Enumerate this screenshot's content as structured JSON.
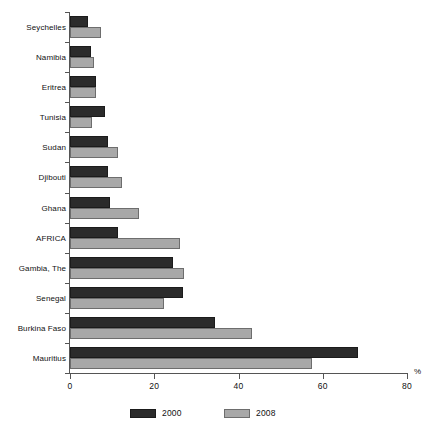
{
  "chart_data": {
    "type": "bar",
    "orientation": "horizontal",
    "title": "",
    "xlabel": "%",
    "ylabel": "",
    "xlim": [
      0,
      80
    ],
    "xticks": [
      0,
      20,
      40,
      60,
      80
    ],
    "xtick_labels": [
      "0",
      "20",
      "40",
      "60",
      "80"
    ],
    "grid": false,
    "legend_position": "bottom",
    "categories": [
      "Seychelles",
      "Namibia",
      "Eritrea",
      "Tunisia",
      "Sudan",
      "Djibouti",
      "Ghana",
      "AFRICA",
      "Gambia, The",
      "Senegal",
      "Burkina Faso",
      "Mauritius"
    ],
    "series": [
      {
        "name": "2000",
        "color": "#2b2b2b",
        "values": [
          4.3,
          5.1,
          6.1,
          8.3,
          9.0,
          9.1,
          9.6,
          11.4,
          24.5,
          26.8,
          34.5,
          68.4
        ]
      },
      {
        "name": "2008",
        "color": "#a8a8a8",
        "values": [
          7.4,
          5.7,
          6.1,
          5.2,
          11.4,
          12.4,
          16.4,
          26.1,
          27.1,
          22.3,
          43.2,
          57.4
        ]
      }
    ]
  },
  "legend": {
    "entries": [
      {
        "label": "2000"
      },
      {
        "label": "2008"
      }
    ]
  },
  "axis": {
    "unit_label": "%"
  }
}
